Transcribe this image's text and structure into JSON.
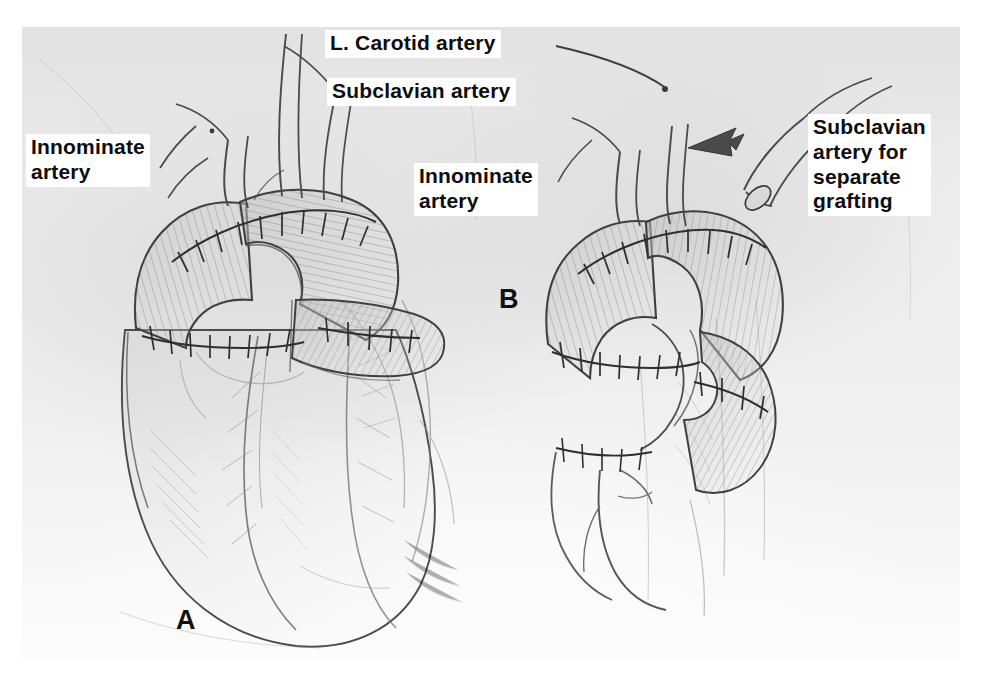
{
  "figure": {
    "kind": "medical-illustration",
    "background_color": "#eeeeee",
    "page_color": "#ffffff",
    "ink_color": "#3a3a3a"
  },
  "labels": {
    "l_carotid_artery": "L. Carotid artery",
    "subclavian_artery": "Subclavian artery",
    "innominate_artery_a": "Innominate\nartery",
    "innominate_artery_b": "Innominate\nartery",
    "subclavian_for_grafting": "Subclavian\nartery for\nseparate\ngrafting"
  },
  "panels": {
    "a": {
      "letter": "A",
      "description": "Aortic arch graft anastomosed to innominate, left carotid and subclavian arteries with heart visible below"
    },
    "b": {
      "letter": "B",
      "description": "Aortic arch graft with subclavian artery divided and reserved for separate grafting"
    }
  },
  "annotations": {
    "leader_line": "leader-line-carotid",
    "arrow": "arrow-to-subclavian-stump"
  }
}
